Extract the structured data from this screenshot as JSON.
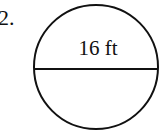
{
  "problem": {
    "number": "2.",
    "shape": "circle",
    "segment": "diameter",
    "label": "16 ft",
    "diameter_value": 16,
    "unit": "ft"
  }
}
